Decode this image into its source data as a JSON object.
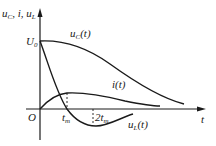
{
  "diagram": {
    "type": "waveform-plot",
    "y_axis_label": {
      "base1": "u",
      "sub1": "C",
      "sep1": ", ",
      "i": "i",
      "sep2": ", ",
      "base2": "u",
      "sub2": "L"
    },
    "x_axis_label": "t",
    "origin_label": "O",
    "u0_label": {
      "base": "U",
      "sub": "0"
    },
    "tick_labels": [
      {
        "prefix": "t",
        "sub": "m"
      },
      {
        "prefix": "2t",
        "sub": "m"
      }
    ],
    "curves": [
      {
        "name": "uC",
        "label_base": "u",
        "label_sub": "C",
        "label_arg": "(t)"
      },
      {
        "name": "i",
        "label_base": "i",
        "label_sub": "",
        "label_arg": "(t)"
      },
      {
        "name": "uL",
        "label_base": "u",
        "label_sub": "L",
        "label_arg": "(t)"
      }
    ],
    "colors": {
      "stroke": "#1a1a1a",
      "background": "#ffffff"
    }
  }
}
